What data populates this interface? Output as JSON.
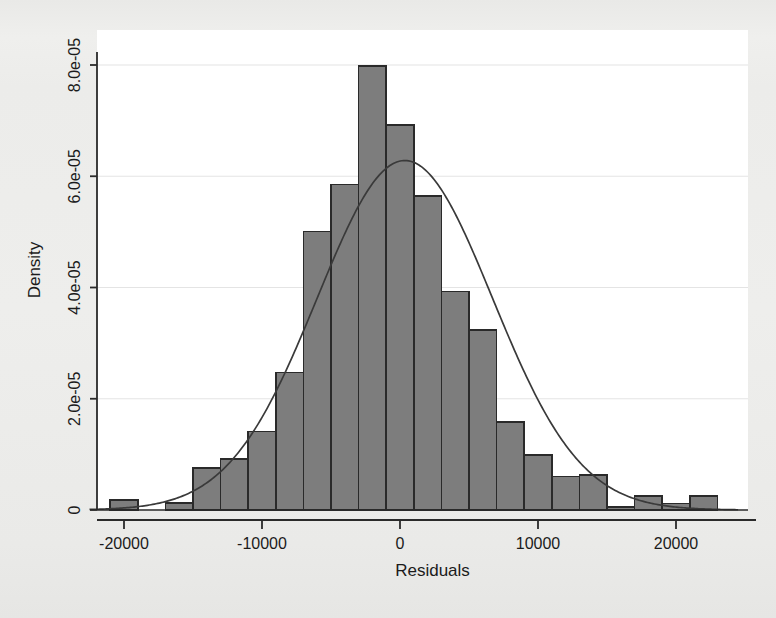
{
  "figure": {
    "background_color": "#ececea",
    "plot_background_color": "#ffffff",
    "bar_fill_color": "#7d7d7d",
    "bar_border_color": "#2a2a2a",
    "curve_color": "#3a3a3a",
    "grid_color": "#e4e4e4",
    "axis_color": "#2a2a2a"
  },
  "chart_data": {
    "type": "bar",
    "title": "",
    "subtitle": "",
    "xlabel": "Residuals",
    "ylabel": "Density",
    "xlim": [
      -22500,
      24500
    ],
    "ylim": [
      0,
      8.6e-05
    ],
    "xticks": [
      -20000,
      -10000,
      0,
      10000,
      20000
    ],
    "xtick_labels": [
      "-20000",
      "-10000",
      "0",
      "10000",
      "20000"
    ],
    "yticks": [
      0,
      2e-05,
      4e-05,
      6e-05,
      8e-05
    ],
    "ytick_labels": [
      "0",
      "2.0e-05",
      "4.0e-05",
      "6.0e-05",
      "8.0e-05"
    ],
    "grid": "horizontal",
    "legend": "none",
    "legend_position": "none",
    "bin_width": 2000,
    "bin_edges": [
      -21000,
      -19000,
      -17000,
      -15000,
      -13000,
      -11000,
      -9000,
      -7000,
      -5000,
      -3000,
      -1000,
      1000,
      3000,
      5000,
      7000,
      9000,
      11000,
      13000,
      15000,
      17000,
      19000,
      21000,
      23000,
      25000
    ],
    "bin_centers": [
      -20000,
      -18000,
      -16000,
      -14000,
      -12000,
      -10000,
      -8000,
      -6000,
      -4000,
      -2000,
      0,
      2000,
      4000,
      6000,
      8000,
      10000,
      12000,
      14000,
      16000,
      18000,
      20000,
      22000,
      24000
    ],
    "values": [
      1.8e-06,
      0.0,
      1.3e-06,
      7.5e-06,
      9.2e-06,
      1.41e-05,
      2.47e-05,
      5.01e-05,
      5.85e-05,
      7.98e-05,
      6.92e-05,
      5.64e-05,
      3.93e-05,
      3.24e-05,
      1.58e-05,
      9.9e-06,
      6e-06,
      6.3e-06,
      5e-07,
      2.5e-06,
      1.2e-06,
      2.5e-06,
      0.0
    ],
    "overlay": {
      "type": "line",
      "name": "normal density",
      "mean": 350,
      "sd": 6350,
      "peak": 6.28e-05
    }
  }
}
